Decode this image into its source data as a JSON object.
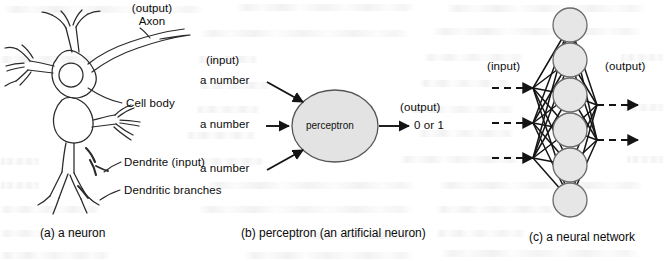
{
  "figure": {
    "width": 664,
    "height": 261,
    "background": "#ffffff",
    "ink": "#0b0b0b",
    "node_fill": "#e6e6e6",
    "node_stroke": "#6b6b6b",
    "perceptron_fill": "#e3e3e3",
    "perceptron_stroke": "#555555"
  },
  "panel_a": {
    "caption": "(a) a neuron",
    "labels": {
      "axon_output": "(output)",
      "axon": "Axon",
      "cell_body": "Cell body",
      "dendrite_input": "Dendrite (input)",
      "dendritic_branches": "Dendritic branches"
    }
  },
  "panel_b": {
    "caption": "(b) perceptron (an artificial neuron)",
    "input_header": "(input)",
    "inputs": [
      "a number",
      "a number",
      "a number"
    ],
    "node_label": "perceptron",
    "output_header": "(output)",
    "output_value": "0 or 1"
  },
  "panel_c": {
    "caption": "(c) a neural network",
    "input_header": "(input)",
    "output_header": "(output)",
    "node_count": 6,
    "input_arrow_count": 3,
    "output_arrow_count": 2
  }
}
